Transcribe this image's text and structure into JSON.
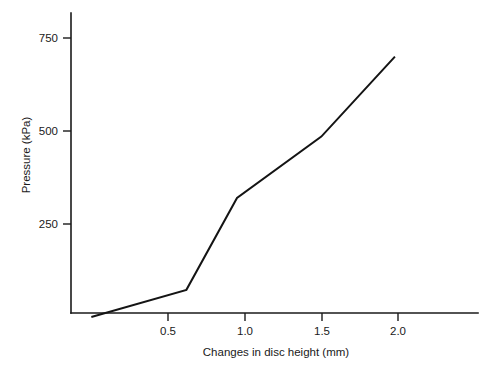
{
  "chart_data": {
    "type": "line",
    "title": "",
    "subtitle": "",
    "xlabel": "Changes in disc height (mm)",
    "ylabel": "Pressure (kPa)",
    "xlim": [
      0,
      2.52
    ],
    "ylim": [
      0,
      810
    ],
    "xticks": [
      0.5,
      1.0,
      1.5,
      2.0
    ],
    "xtick_labels": [
      "0.5",
      "1.0",
      "1.5",
      "2.0"
    ],
    "yticks": [
      250,
      500,
      750
    ],
    "ytick_labels": [
      "250",
      "500",
      "750"
    ],
    "grid": false,
    "legend": null,
    "legend_position": "none",
    "annotations": [],
    "series": [
      {
        "name": "Pressure vs change in disc height",
        "color": "#141414",
        "x": [
          0.0,
          0.62,
          0.95,
          1.5,
          1.98
        ],
        "y": [
          0,
          73,
          320,
          485,
          700
        ],
        "points": [
          {
            "x": 0.0,
            "y": 0
          },
          {
            "x": 0.62,
            "y": 73
          },
          {
            "x": 0.95,
            "y": 320
          },
          {
            "x": 1.5,
            "y": 485
          },
          {
            "x": 1.98,
            "y": 700
          }
        ]
      }
    ]
  },
  "axes": {
    "y_axis_name": "pressure-axis",
    "x_axis_name": "disc-height-axis"
  }
}
